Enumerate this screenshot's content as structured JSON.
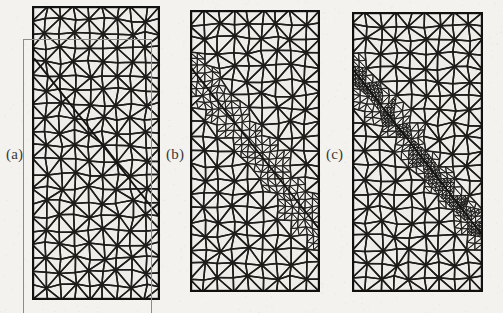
{
  "figure": {
    "kind": "finite-element-mesh-comparison",
    "background_color": "#f3f2ef",
    "panel_fill_color": "#eeedea",
    "line_color": "#1d1d1b",
    "width": 503,
    "height": 313
  },
  "panels": [
    {
      "id": "a",
      "label": "(a)",
      "label_x": 6,
      "label_y": 146,
      "x": 32,
      "y": 6,
      "width": 128,
      "height": 294,
      "cols": 9,
      "rows": 21,
      "refinement": "none",
      "refine_levels": 0,
      "edge_width": 1.5,
      "border_width": 2.2,
      "crack": {
        "x1": 0.02,
        "y1": 0.18,
        "x2": 1.0,
        "y2": 0.72
      },
      "ghost_outline": {
        "x": 23,
        "y": 39,
        "width": 128,
        "height": 274
      },
      "description": "uniform coarse triangular mesh, unrefined, with offset duplicate outline scan artifact"
    },
    {
      "id": "b",
      "label": "(b)",
      "label_x": 166,
      "label_y": 146,
      "x": 190,
      "y": 10,
      "width": 130,
      "height": 282,
      "cols": 9,
      "rows": 20,
      "refinement": "one-level",
      "refine_levels": 1,
      "refine_band": 0.085,
      "edge_width": 1.5,
      "border_width": 2.2,
      "crack": {
        "x1": 0.0,
        "y1": 0.2,
        "x2": 1.0,
        "y2": 0.78
      },
      "description": "triangular mesh with single-level local refinement along the diagonal interface"
    },
    {
      "id": "c",
      "label": "(c)",
      "label_x": 326,
      "label_y": 146,
      "x": 352,
      "y": 12,
      "width": 131,
      "height": 280,
      "cols": 9,
      "rows": 20,
      "refinement": "two-level",
      "refine_levels": 2,
      "refine_band": 0.075,
      "edge_width": 1.5,
      "border_width": 2.2,
      "crack": {
        "x1": 0.0,
        "y1": 0.2,
        "x2": 1.0,
        "y2": 0.8
      },
      "description": "triangular mesh with two-level local refinement concentrated along the diagonal interface"
    }
  ]
}
